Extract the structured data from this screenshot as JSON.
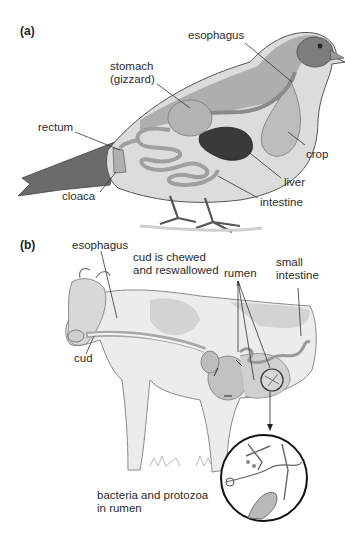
{
  "figure": {
    "panel_a": {
      "tag": "(a)",
      "subject": "bird",
      "labels": {
        "esophagus": "esophagus",
        "stomach_line1": "stomach",
        "stomach_line2": "(gizzard)",
        "rectum": "rectum",
        "crop": "crop",
        "liver": "liver",
        "cloaca": "cloaca",
        "intestine": "intestine"
      }
    },
    "panel_b": {
      "tag": "(b)",
      "subject": "cow",
      "labels": {
        "esophagus": "esophagus",
        "cud_chewed_line1": "cud is chewed",
        "cud_chewed_line2": "and reswallowed",
        "rumen": "rumen",
        "small_intestine_line1": "small",
        "small_intestine_line2": "intestine",
        "cud": "cud",
        "bacteria_line1": "bacteria and protozoa",
        "bacteria_line2": "in rumen"
      }
    },
    "colors": {
      "ink": "#2b2b2b",
      "organ_fill": "#bdbdbd",
      "liver_fill": "#3a3a3a",
      "body_fill": "#e6e6e6"
    }
  }
}
